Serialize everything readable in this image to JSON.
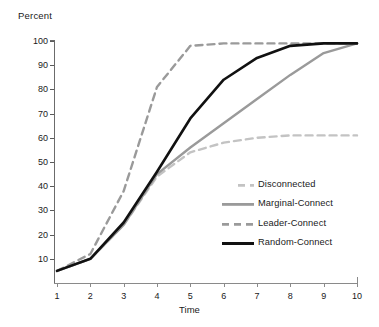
{
  "chart_data": {
    "type": "line",
    "title": "",
    "xlabel": "Time",
    "ylabel": "Percent",
    "xlim": [
      1,
      10
    ],
    "ylim": [
      0,
      100
    ],
    "grid": false,
    "legend_position": "lower-right",
    "x": [
      1,
      2,
      3,
      4,
      5,
      6,
      7,
      8,
      9,
      10
    ],
    "xticklabels": [
      "1",
      "2",
      "3",
      "4",
      "5",
      "6",
      "7",
      "8",
      "9",
      "10"
    ],
    "yticklabels": [
      "10",
      "20",
      "30",
      "40",
      "50",
      "60",
      "70",
      "80",
      "90",
      "100"
    ],
    "yticks": [
      10,
      20,
      30,
      40,
      50,
      60,
      70,
      80,
      90,
      100
    ],
    "series": [
      {
        "name": "Disconnected",
        "color": "#c3c3c3",
        "style": "dashed",
        "width": 2.4,
        "values": [
          5,
          10,
          24,
          44,
          54,
          58,
          60,
          61,
          61,
          61
        ]
      },
      {
        "name": "Marginal-Connect",
        "color": "#9a9a9a",
        "style": "solid",
        "width": 2.4,
        "values": [
          5,
          10,
          24,
          45,
          56,
          66,
          76,
          86,
          95,
          99
        ]
      },
      {
        "name": "Leader-Connect",
        "color": "#9a9a9a",
        "style": "dashed",
        "width": 2.4,
        "values": [
          5,
          12,
          38,
          81,
          98,
          99,
          99,
          99,
          99,
          99
        ]
      },
      {
        "name": "Random-Connect",
        "color": "#111111",
        "style": "solid",
        "width": 2.6,
        "values": [
          5,
          10,
          25,
          46,
          68,
          84,
          93,
          98,
          99,
          99
        ]
      }
    ]
  },
  "legend": {
    "items": [
      {
        "label": "Disconnected"
      },
      {
        "label": "Marginal-Connect"
      },
      {
        "label": "Leader-Connect"
      },
      {
        "label": "Random-Connect"
      }
    ]
  }
}
